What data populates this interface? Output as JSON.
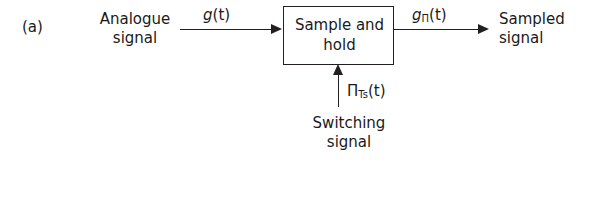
{
  "figure": {
    "panel_label": "(a)",
    "background_color": "#ffffff",
    "line_color": "#231f20",
    "text_color": "#1a1a1a"
  },
  "block": {
    "label_line1": "Sample and",
    "label_line2": "hold"
  },
  "input": {
    "caption_line1": "Analogue",
    "caption_line2": "signal",
    "signal_base": "g",
    "signal_subscript": "",
    "signal_arg": "(t)"
  },
  "output": {
    "caption_line1": "Sampled",
    "caption_line2": "signal",
    "signal_base": "g",
    "signal_subscript": "Π",
    "signal_arg": "(t)"
  },
  "clock": {
    "caption_line1": "Switching",
    "caption_line2": "signal",
    "signal_base": "Π",
    "signal_subscript": "Ts",
    "signal_arg": "(t)"
  },
  "connectors": {
    "input_arrow_direction": "right",
    "output_arrow_direction": "right",
    "clock_arrow_direction": "up"
  }
}
